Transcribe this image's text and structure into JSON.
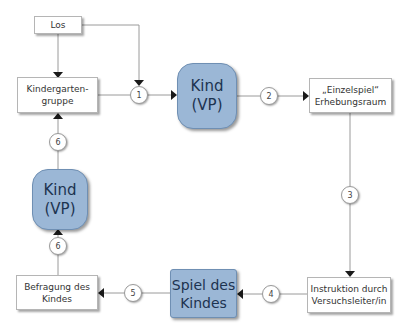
{
  "diagram": {
    "nodes": {
      "los": "Los",
      "kindergarten_line1": "Kindergarten-",
      "kindergarten_line2": "gruppe",
      "kind_top_line1": "Kind",
      "kind_top_line2": "(VP)",
      "einzelspiel_line1": "„Einzelspiel“",
      "einzelspiel_line2": "Erhebungsraum",
      "instruktion_line1": "Instruktion durch",
      "instruktion_line2": "Versuchsleiter/in",
      "spiel_line1": "Spiel des",
      "spiel_line2": "Kindes",
      "befragung_line1": "Befragung des",
      "befragung_line2": "Kindes",
      "kind_bottom_line1": "Kind",
      "kind_bottom_line2": "(VP)"
    },
    "steps": [
      "1",
      "2",
      "3",
      "4",
      "5",
      "6",
      "6"
    ],
    "colors": {
      "blue_fill": "#9bb7d6",
      "blue_text": "#1d3350",
      "line": "#9a9a9a",
      "arrow": "#1a1a1a"
    }
  }
}
